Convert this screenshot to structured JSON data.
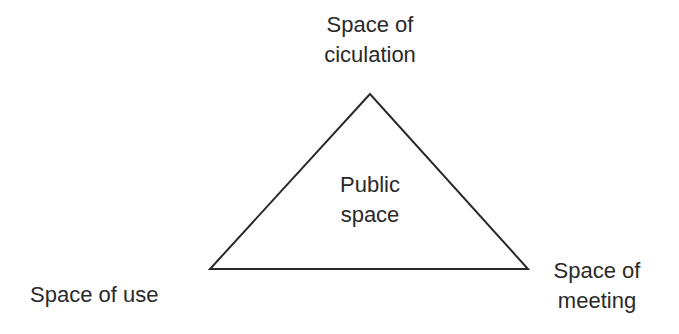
{
  "diagram": {
    "type": "triangle",
    "stroke_color": "#2a2a2a",
    "background": "#ffffff",
    "vertices": {
      "top": {
        "line1": "Space of",
        "line2": "ciculation"
      },
      "left": {
        "line1": "Space of use"
      },
      "right": {
        "line1": "Space of",
        "line2": "meeting"
      }
    },
    "center": {
      "line1": "Public",
      "line2": "space"
    }
  }
}
